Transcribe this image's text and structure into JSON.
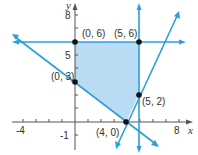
{
  "diagram": {
    "type": "feasible-region",
    "axes": {
      "x_label": "x",
      "y_label": "y",
      "x_ticks_labeled": [
        "-4",
        "8"
      ],
      "y_ticks_labeled": [
        "8",
        "5",
        "-1"
      ]
    },
    "vertices": [
      {
        "label": "(0, 6)",
        "x": 0,
        "y": 6
      },
      {
        "label": "(5, 6)",
        "x": 5,
        "y": 6
      },
      {
        "label": "(0, 3)",
        "x": 0,
        "y": 3
      },
      {
        "label": "(5, 2)",
        "x": 5,
        "y": 2
      },
      {
        "label": "(4, 0)",
        "x": 4,
        "y": 0
      }
    ],
    "lines": [
      {
        "name": "y = 6"
      },
      {
        "name": "x = 5"
      },
      {
        "name": "3x + 4y = 12"
      },
      {
        "name": "2x - y = 8"
      }
    ],
    "colors": {
      "line": "#2a9fd8",
      "fill": "#b9dcf4",
      "point": "#111111",
      "axis": "#555555"
    }
  }
}
